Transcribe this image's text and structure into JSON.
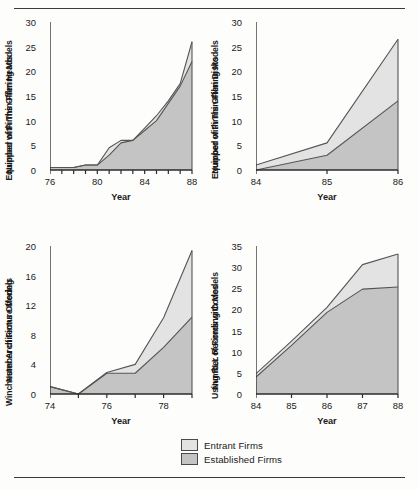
{
  "figure": {
    "legend": {
      "entrant_label": "Entrant Firms",
      "established_label": "Established Firms",
      "entrant_color": "#e3e3e3",
      "established_color": "#c4c4c4",
      "line_color": "#555555"
    }
  },
  "chart_data": [
    {
      "id": "thin-film-heads",
      "type": "area",
      "title": "",
      "ylabel": "Number of Firms Offering Models\nEquipped with Thin-Film Heads",
      "ylabel_line1": "Number of Firms Offering Models",
      "ylabel_line2": "Equipped with Thin-Film Heads",
      "xlabel": "Year",
      "xlim": [
        76,
        88
      ],
      "ylim": [
        0,
        30
      ],
      "xticks": [
        76,
        77,
        78,
        79,
        80,
        81,
        82,
        83,
        84,
        85,
        86,
        87,
        88
      ],
      "xticklabels": [
        "76",
        "",
        "",
        "",
        "80",
        "",
        "",
        "",
        "84",
        "",
        "",
        "",
        "88"
      ],
      "yticks": [
        0,
        5,
        10,
        15,
        20,
        25,
        30
      ],
      "yticklabels": [
        "0",
        "5",
        "10",
        "15",
        "20",
        "25",
        "30"
      ],
      "grid": false,
      "stacked": true,
      "x": [
        76,
        77,
        78,
        79,
        80,
        81,
        82,
        83,
        84,
        85,
        86,
        87,
        88
      ],
      "series": [
        {
          "name": "Established Firms",
          "values": [
            0.5,
            0.5,
            0.5,
            1,
            1,
            3,
            5.5,
            6,
            8,
            10,
            13.5,
            17,
            22
          ]
        },
        {
          "name": "Entrant Firms",
          "values": [
            0,
            0,
            0,
            0,
            0,
            1.5,
            0.5,
            0,
            0.5,
            1,
            0.5,
            0.5,
            4
          ]
        }
      ],
      "totals": [
        0.5,
        0.5,
        0.5,
        1,
        1,
        4.5,
        6,
        6,
        8.5,
        11,
        14,
        17.5,
        26
      ]
    },
    {
      "id": "thin-film-disks",
      "type": "area",
      "title": "",
      "ylabel": "Number of Firms Offering Models\nEquipped with Thin-Film Disks",
      "ylabel_line1": "Number of Firms Offering Models",
      "ylabel_line2": "Equipped with Thin-Film Disks",
      "xlabel": "Year",
      "xlim": [
        84,
        86
      ],
      "ylim": [
        0,
        30
      ],
      "xticks": [
        84,
        85,
        86
      ],
      "xticklabels": [
        "84",
        "85",
        "86"
      ],
      "yticks": [
        0,
        5,
        10,
        15,
        20,
        25,
        30
      ],
      "yticklabels": [
        "0",
        "5",
        "10",
        "15",
        "20",
        "25",
        "30"
      ],
      "grid": false,
      "stacked": true,
      "x": [
        84,
        85,
        86
      ],
      "series": [
        {
          "name": "Established Firms",
          "values": [
            0,
            3,
            14
          ]
        },
        {
          "name": "Entrant Firms",
          "values": [
            1,
            2.5,
            12.5
          ]
        }
      ],
      "totals": [
        1,
        5.5,
        26.5
      ]
    },
    {
      "id": "winchester-architecture",
      "type": "area",
      "title": "",
      "ylabel": "Number of Firms Offering\nWinchester Architecture Models",
      "ylabel_line1": "Number of Firms Offering",
      "ylabel_line2": "Winchester Architecture Models",
      "xlabel": "Year",
      "xlim": [
        74,
        79
      ],
      "ylim": [
        0,
        20
      ],
      "xticks": [
        74,
        75,
        76,
        77,
        78,
        79
      ],
      "xticklabels": [
        "74",
        "",
        "76",
        "",
        "78",
        ""
      ],
      "yticks": [
        0,
        4,
        8,
        12,
        16,
        20
      ],
      "yticklabels": [
        "0",
        "4",
        "8",
        "12",
        "16",
        "20"
      ],
      "grid": false,
      "stacked": true,
      "x": [
        74,
        75,
        76,
        77,
        78,
        79
      ],
      "series": [
        {
          "name": "Established Firms",
          "values": [
            1,
            0,
            2.8,
            2.8,
            6.3,
            10.4
          ]
        },
        {
          "name": "Entrant Firms",
          "values": [
            0,
            0,
            0.1,
            1.2,
            4.0,
            9.0
          ]
        }
      ],
      "totals": [
        1,
        0,
        2.9,
        4.0,
        10.3,
        19.4
      ]
    },
    {
      "id": "rll-recording-codes",
      "type": "area",
      "title": "",
      "ylabel": "Number of Firms with Models\nUsing RLL Recording Codes",
      "ylabel_line1": "Number of Firms with Models",
      "ylabel_line2": "Using RLL Recording Codes",
      "xlabel": "Year",
      "xlim": [
        84,
        88
      ],
      "ylim": [
        0,
        35
      ],
      "xticks": [
        84,
        85,
        86,
        87,
        88
      ],
      "xticklabels": [
        "84",
        "85",
        "86",
        "87",
        "88"
      ],
      "yticks": [
        0,
        5,
        10,
        15,
        20,
        25,
        30,
        35
      ],
      "yticklabels": [
        "0",
        "5",
        "10",
        "15",
        "20",
        "25",
        "30",
        "35"
      ],
      "grid": false,
      "stacked": true,
      "x": [
        84,
        85,
        86,
        87,
        88
      ],
      "series": [
        {
          "name": "Established Firms",
          "values": [
            4,
            11.5,
            19.3,
            24.8,
            25.3
          ]
        },
        {
          "name": "Entrant Firms",
          "values": [
            0.8,
            1.0,
            1.2,
            5.8,
            7.8
          ]
        }
      ],
      "totals": [
        4.8,
        12.5,
        20.5,
        30.6,
        33.1
      ]
    }
  ]
}
